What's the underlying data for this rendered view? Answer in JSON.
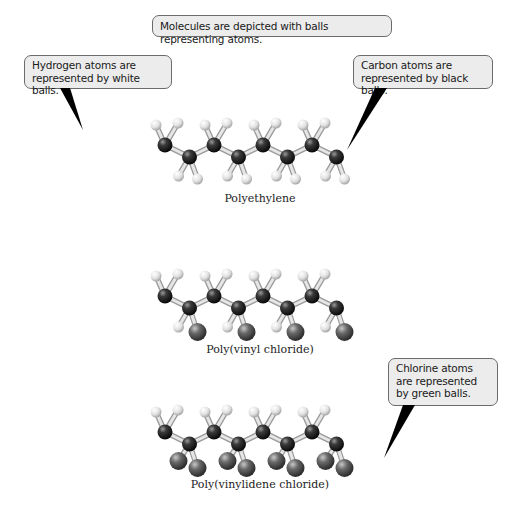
{
  "title_callout": "Molecules are depicted with balls representing atoms.",
  "callouts": {
    "hydrogen": "Hydrogen atoms are represented by white balls.",
    "carbon": "Carbon atoms are represented by black balls.",
    "chlorine": "Chlorine atoms are represented by green balls."
  },
  "molecules": [
    {
      "name": "Polyethylene",
      "substituents": "H,H"
    },
    {
      "name": "Poly(vinyl chloride)",
      "substituents": "H,Cl"
    },
    {
      "name": "Poly(vinylidene chloride)",
      "substituents": "Cl,Cl"
    }
  ],
  "colors": {
    "carbon": "#2a2a2a",
    "hydrogen": "#e8e8e8",
    "chlorine": "#5a5a5a",
    "callout_bg": "#ececec",
    "callout_border": "#6b6b6b"
  }
}
